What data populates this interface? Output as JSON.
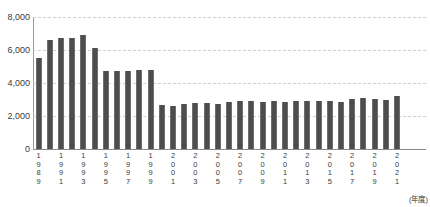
{
  "chart_data": {
    "type": "bar",
    "title": "",
    "xlabel": "(年度)",
    "ylabel": "",
    "ylim": [
      0,
      8000
    ],
    "ytick_step": 2000,
    "grid": true,
    "legend": null,
    "bar_color": "#4d4d4d",
    "grid_color": "#cfcfcf",
    "axis_color": "#8a8a8a",
    "y_ticks": [
      "0",
      "2,000",
      "4,000",
      "6,000",
      "8,000"
    ],
    "y_tick_values": [
      0,
      2000,
      4000,
      6000,
      8000
    ],
    "categories": [
      "1989",
      "1990",
      "1991",
      "1992",
      "1993",
      "1994",
      "1995",
      "1996",
      "1997",
      "1998",
      "1999",
      "2000",
      "2001",
      "2002",
      "2003",
      "2004",
      "2005",
      "2006",
      "2007",
      "2008",
      "2009",
      "2010",
      "2011",
      "2012",
      "2013",
      "2014",
      "2015",
      "2016",
      "2017",
      "2018",
      "2019",
      "2020",
      "2021"
    ],
    "tick_labels_shown": [
      "1989",
      "1991",
      "1993",
      "1995",
      "1997",
      "1999",
      "2001",
      "2003",
      "2005",
      "2007",
      "2009",
      "2011",
      "2013",
      "2015",
      "2017",
      "2019",
      "2021"
    ],
    "values": [
      5500,
      6600,
      6700,
      6750,
      6900,
      6100,
      4700,
      4700,
      4750,
      4800,
      4800,
      2650,
      2600,
      2750,
      2800,
      2800,
      2750,
      2850,
      2900,
      2900,
      2850,
      2900,
      2850,
      2900,
      2900,
      2900,
      2900,
      2850,
      3050,
      3100,
      3050,
      2950,
      3200
    ]
  }
}
